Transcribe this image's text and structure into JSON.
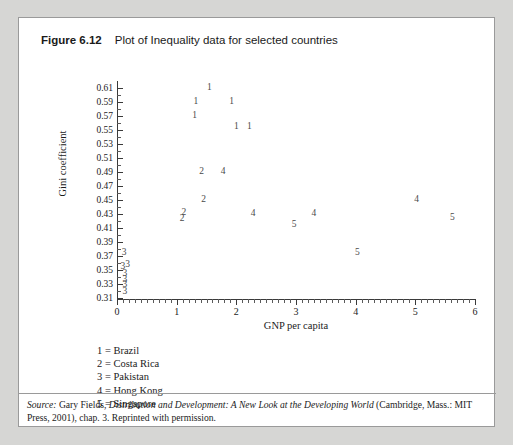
{
  "figure": {
    "number": "Figure 6.12",
    "caption": "Plot of Inequality data for selected countries"
  },
  "chart_data": {
    "type": "scatter",
    "title": "Plot of Inequality data for selected countries",
    "xlabel": "GNP per capita",
    "ylabel": "Gini coefficient",
    "xlim": [
      0,
      6
    ],
    "ylim": [
      0.31,
      0.61
    ],
    "grid": false,
    "legend_position": "below-plot",
    "x_ticks": [
      0,
      1,
      2,
      3,
      4,
      5,
      6
    ],
    "x_tick_labels": [
      "0",
      "1",
      "2",
      "3",
      "4",
      "5",
      "6"
    ],
    "x_minor_tick_step": 0.1,
    "y_ticks": [
      0.31,
      0.33,
      0.35,
      0.37,
      0.39,
      0.41,
      0.43,
      0.45,
      0.47,
      0.49,
      0.51,
      0.53,
      0.55,
      0.57,
      0.59,
      0.61
    ],
    "y_tick_labels": [
      "0.31",
      "0.33",
      "0.35",
      "0.37",
      "0.39",
      "0.41",
      "0.43",
      "0.45",
      "0.47",
      "0.49",
      "0.51",
      "0.53",
      "0.55",
      "0.57",
      "0.59",
      "0.61"
    ],
    "y_minor_tick_step": 0.01,
    "marker_style": "numeric-label",
    "series": [
      {
        "name": "Brazil",
        "code": "1",
        "points": [
          {
            "x": 1.55,
            "y": 0.61
          },
          {
            "x": 1.32,
            "y": 0.59
          },
          {
            "x": 1.92,
            "y": 0.59
          },
          {
            "x": 1.3,
            "y": 0.57
          },
          {
            "x": 2.0,
            "y": 0.555
          },
          {
            "x": 2.22,
            "y": 0.555
          }
        ]
      },
      {
        "name": "Costa Rica",
        "code": "2",
        "points": [
          {
            "x": 1.42,
            "y": 0.49
          },
          {
            "x": 1.45,
            "y": 0.45
          },
          {
            "x": 1.12,
            "y": 0.432
          },
          {
            "x": 1.09,
            "y": 0.423
          }
        ]
      },
      {
        "name": "Pakistan",
        "code": "3",
        "points": [
          {
            "x": 0.12,
            "y": 0.375
          },
          {
            "x": 0.1,
            "y": 0.355
          },
          {
            "x": 0.18,
            "y": 0.357
          },
          {
            "x": 0.13,
            "y": 0.345
          },
          {
            "x": 0.13,
            "y": 0.336
          },
          {
            "x": 0.13,
            "y": 0.328
          },
          {
            "x": 0.13,
            "y": 0.318
          }
        ]
      },
      {
        "name": "Hong Kong",
        "code": "4",
        "points": [
          {
            "x": 1.78,
            "y": 0.49
          },
          {
            "x": 2.28,
            "y": 0.43
          },
          {
            "x": 3.3,
            "y": 0.43
          },
          {
            "x": 5.02,
            "y": 0.45
          }
        ]
      },
      {
        "name": "Singapore",
        "code": "5",
        "points": [
          {
            "x": 2.97,
            "y": 0.415
          },
          {
            "x": 4.03,
            "y": 0.375
          },
          {
            "x": 5.62,
            "y": 0.425
          }
        ]
      }
    ]
  },
  "legend": {
    "entries": [
      {
        "code": "1",
        "separator": "=",
        "country": "Brazil"
      },
      {
        "code": "2",
        "separator": "=",
        "country": "Costa Rica"
      },
      {
        "code": "3",
        "separator": "=",
        "country": "Pakistan"
      },
      {
        "code": "4",
        "separator": "=",
        "country": "Hong Kong"
      },
      {
        "code": "5",
        "separator": "=",
        "country": "Singapore"
      }
    ]
  },
  "source": {
    "label": "Source:",
    "author": "Gary Fields,",
    "work": "Distribution and Development: A New Look at the Developing World",
    "publication": "(Cambridge, Mass.: MIT Press, 2001), chap. 3. Reprinted with permission."
  },
  "colors": {
    "page_background": "#d6d6d4",
    "panel_background": "#ffffff",
    "panel_border": "#9a9a9a",
    "axis": "#3a3a3a",
    "text": "#1b1b1b",
    "marker": "#4a4a4a"
  }
}
